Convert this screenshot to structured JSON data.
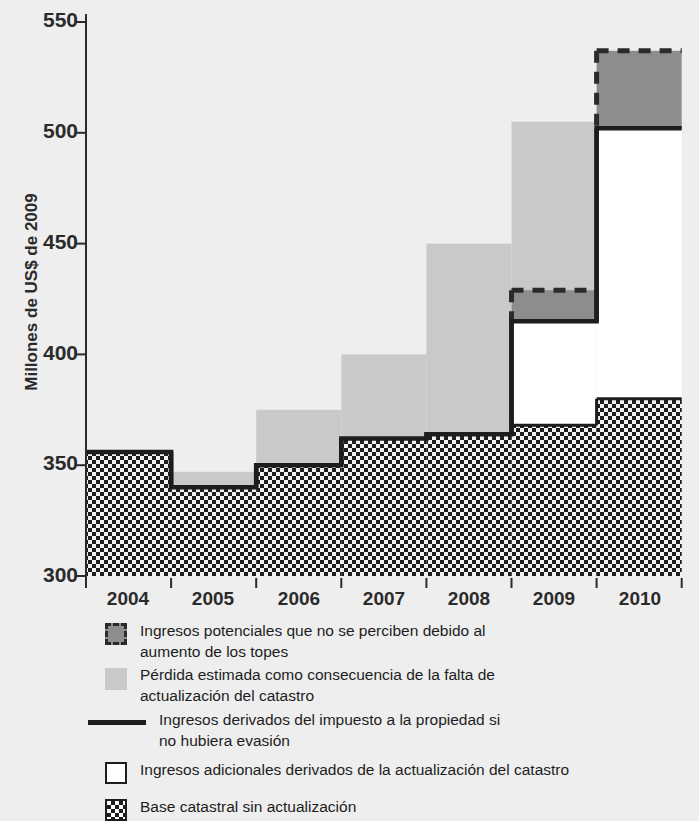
{
  "chart_data": {
    "type": "area",
    "title": "",
    "xlabel": "",
    "ylabel": "Millones de US$ de 2009",
    "categories": [
      "2004",
      "2005",
      "2006",
      "2007",
      "2008",
      "2009",
      "2010"
    ],
    "ylim": [
      300,
      550
    ],
    "yticks": [
      300,
      350,
      400,
      450,
      500,
      550
    ],
    "grid": false,
    "legend_position": "below",
    "series": [
      {
        "name": "Base catastral sin actualización",
        "key": "base_catastral",
        "values": [
          356,
          340,
          350,
          362,
          364,
          368,
          380
        ],
        "style": "checkered-fill",
        "color": "#ffffff"
      },
      {
        "name": "Ingresos adicionales derivados de la actualización del catastro",
        "key": "ingresos_adicionales",
        "values": [
          356,
          340,
          350,
          362,
          364,
          415,
          502
        ],
        "note": "upper bound of white band; equals solid line",
        "style": "white-fill",
        "color": "#ffffff"
      },
      {
        "name": "Ingresos derivados del impuesto a la propiedad si no hubiera evasión",
        "key": "linea_sin_evasion",
        "values": [
          356,
          340,
          350,
          362,
          364,
          415,
          502
        ],
        "style": "solid-line",
        "color": "#1d1d1d"
      },
      {
        "name": "Ingresos potenciales que no se perciben debido al aumento de los topes",
        "key": "topes",
        "values": [
          356,
          340,
          350,
          362,
          364,
          429,
          537
        ],
        "note": "upper bound of dark-gray dashed band",
        "style": "dashed-fill",
        "color": "#8d8d8d"
      },
      {
        "name": "Pérdida estimada como consecuencia de la falta de actualización del catastro",
        "key": "perdida_catastro",
        "values": [
          356,
          347,
          375,
          400,
          450,
          505,
          537
        ],
        "note": "top of light-gray band",
        "style": "light-gray-fill",
        "color": "#c9c9c9"
      }
    ]
  },
  "axis": {
    "ylabel": "Millones de US$ de 2009",
    "ytick_labels": [
      "550",
      "500",
      "450",
      "400",
      "350",
      "300"
    ],
    "xtick_labels": [
      "2004",
      "2005",
      "2006",
      "2007",
      "2008",
      "2009",
      "2010"
    ]
  },
  "legend": {
    "items": [
      {
        "swatch": "dashed-dark-gray-swatch",
        "label": "Ingresos potenciales que no se perciben debido al\naumento de los topes"
      },
      {
        "swatch": "light-gray-swatch",
        "label": "Pérdida estimada como consecuencia de la falta de\nactualización del catastro"
      },
      {
        "swatch": "solid-line-swatch",
        "label": "Ingresos derivados del impuesto a la propiedad si\nno hubiera evasión"
      },
      {
        "swatch": "white-box-swatch",
        "label": "Ingresos adicionales derivados de la actualización del catastro"
      },
      {
        "swatch": "checkered-box-swatch",
        "label": "Base catastral sin actualización"
      }
    ]
  },
  "colors": {
    "background": "#eeeeee",
    "light_gray": "#c9c9c9",
    "dark_gray": "#8d8d8d",
    "line": "#1d1d1d",
    "white": "#ffffff",
    "text": "#2b2b2b"
  }
}
